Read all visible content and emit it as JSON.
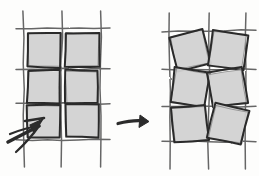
{
  "figure": {
    "title": "Grid of squares before and after rotation",
    "background_color": "#fdfdfc",
    "ink_color": "#2b2b2b",
    "grid_line_color": "#5a5a5a",
    "square_fill_color": "#d2d2d2",
    "square_stroke_color": "#2b2b2b",
    "style": "hand-drawn pencil sketch",
    "caption": ""
  },
  "panels": [
    {
      "id": "left-panel",
      "name": "aligned-grid",
      "label": "",
      "description": "2 by 3 arrangement of axis-aligned gray squares sitting on a ruled grid",
      "grid": {
        "columns": 2,
        "rows": 3,
        "vertical_lines_x": [
          24,
          62,
          100
        ],
        "horizontal_lines_y": [
          29,
          69,
          104,
          139
        ],
        "line_overshoot_top": 18,
        "line_overshoot_bottom": 28,
        "line_overshoot_left": 8,
        "line_overshoot_right": 10
      },
      "squares": [
        {
          "id": "L-r1c1",
          "cx": 44,
          "cy": 50,
          "size": 34,
          "rotation_deg": 0
        },
        {
          "id": "L-r1c2",
          "cx": 82,
          "cy": 50,
          "size": 34,
          "rotation_deg": 0
        },
        {
          "id": "L-r2c1",
          "cx": 44,
          "cy": 87,
          "size": 33,
          "rotation_deg": 0
        },
        {
          "id": "L-r2c2",
          "cx": 82,
          "cy": 87,
          "size": 33,
          "rotation_deg": 0
        },
        {
          "id": "L-r3c1",
          "cx": 44,
          "cy": 121,
          "size": 33,
          "rotation_deg": 0
        },
        {
          "id": "L-r3c2",
          "cx": 82,
          "cy": 121,
          "size": 33,
          "rotation_deg": 0
        }
      ]
    },
    {
      "id": "right-panel",
      "name": "rotated-grid",
      "label": "",
      "description": "same 2 by 3 arrangement with each square individually rotated by a small angle",
      "grid": {
        "columns": 2,
        "rows": 3,
        "vertical_lines_x": [
          170,
          208,
          246
        ],
        "horizontal_lines_y": [
          31,
          69,
          106,
          141
        ],
        "line_overshoot_top": 18,
        "line_overshoot_bottom": 28,
        "line_overshoot_left": 8,
        "line_overshoot_right": 10
      },
      "squares": [
        {
          "id": "R-r1c1",
          "cx": 190,
          "cy": 50,
          "size": 35,
          "rotation_deg": -13
        },
        {
          "id": "R-r1c2",
          "cx": 228,
          "cy": 50,
          "size": 35,
          "rotation_deg": 7
        },
        {
          "id": "R-r2c1",
          "cx": 190,
          "cy": 88,
          "size": 35,
          "rotation_deg": 9
        },
        {
          "id": "R-r2c2",
          "cx": 228,
          "cy": 88,
          "size": 35,
          "rotation_deg": -9
        },
        {
          "id": "R-r3c1",
          "cx": 190,
          "cy": 124,
          "size": 35,
          "rotation_deg": -6
        },
        {
          "id": "R-r3c2",
          "cx": 228,
          "cy": 124,
          "size": 35,
          "rotation_deg": 12
        }
      ]
    }
  ],
  "annotations": {
    "transform_arrow": {
      "name": "transformation-arrow",
      "direction": "right",
      "label": "",
      "from_x": 118,
      "to_x": 149,
      "y": 122,
      "stroke_width": 3.2
    },
    "pointer_arrow": {
      "name": "pointer-arrow",
      "direction": "up-right",
      "label": "",
      "tip_x": 43,
      "tip_y": 124,
      "tail_x": 8,
      "tail_y": 143,
      "stroke_width": 3.6,
      "description": "thick hand-drawn arrow pointing at the lower-left corner of the bottom-left square"
    }
  }
}
